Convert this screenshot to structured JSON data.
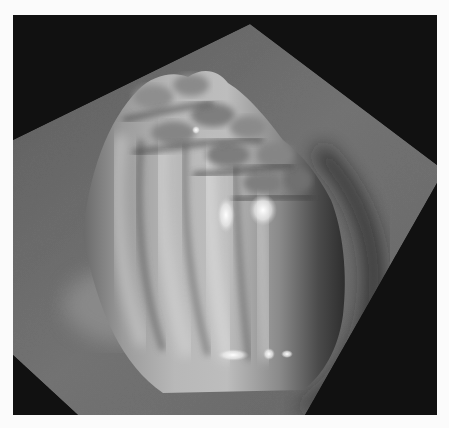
{
  "image": {
    "description": "3D rendered surface topography (scanning-probe style) showing a bulbous mound with ridged lobes on a textured tilted plane against a black background",
    "colors": {
      "page_background": "#fbfbfb",
      "frame_background": "#111111",
      "plane_base": "#6e6e6e",
      "mound_highlight": "#f2f2f2",
      "mound_shadow": "#2a2a2a"
    }
  }
}
